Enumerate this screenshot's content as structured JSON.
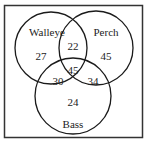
{
  "diagram": {
    "type": "venn",
    "colors": {
      "background": "#ffffff",
      "frame": "#333333",
      "circle_stroke": "#1a1a1a",
      "text": "#222222"
    },
    "sets": [
      {
        "name": "Walleye",
        "only": "27"
      },
      {
        "name": "Perch",
        "only": "45"
      },
      {
        "name": "Bass",
        "only": "24"
      }
    ],
    "intersections": {
      "walleye_perch": "22",
      "walleye_bass": "30",
      "perch_bass": "34",
      "all_three": "45"
    }
  }
}
